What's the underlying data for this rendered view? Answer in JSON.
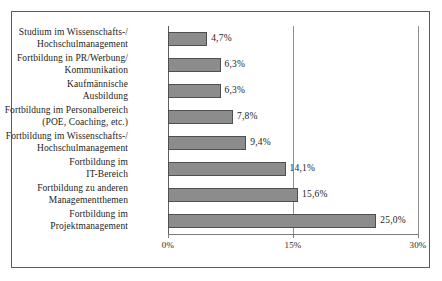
{
  "chart_data": {
    "type": "bar",
    "orientation": "horizontal",
    "title": "",
    "xlabel": "",
    "ylabel": "",
    "xlim": [
      0,
      30
    ],
    "grid": true,
    "legend": false,
    "xticks": [
      "0%",
      "15%",
      "30%"
    ],
    "xtick_values": [
      0,
      15,
      30
    ],
    "categories": [
      "Studium im Wissenschafts-/ Hochschulmanagement",
      "Fortbildung in PR/Werbung/ Kommunikation",
      "Kaufmännische Ausbildung",
      "Fortbildung im Personalbereich (POE, Coaching, etc.)",
      "Fortbildung im Wissenschafts-/ Hochschulmanagement",
      "Fortbildung im IT-Bereich",
      "Fortbildung zu anderen Managementthemen",
      "Fortbildung im Projektmanagement"
    ],
    "category_lines": [
      [
        "Studium im Wissenschafts-/",
        "Hochschulmanagement"
      ],
      [
        "Fortbildung in PR/Werbung/",
        "Kommunikation"
      ],
      [
        "Kaufmännische",
        "Ausbildung"
      ],
      [
        "Fortbildung im Personalbereich",
        "(POE, Coaching, etc.)"
      ],
      [
        "Fortbildung im Wissenschafts-/",
        "Hochschulmanagement"
      ],
      [
        "Fortbildung im",
        "IT-Bereich"
      ],
      [
        "Fortbildung zu anderen",
        "Managementthemen"
      ],
      [
        "Fortbildung im",
        "Projektmanagement"
      ]
    ],
    "values": [
      4.7,
      6.3,
      6.3,
      7.8,
      9.4,
      14.1,
      15.6,
      25.0
    ],
    "data_labels": [
      "4,7%",
      "6,3%",
      "6,3%",
      "7,8%",
      "9,4%",
      "14,1%",
      "15,6%",
      "25,0%"
    ],
    "colors": {
      "bar_fill": "#8c8c8c",
      "bar_border": "#4f4f4f",
      "gridline": "#8e8e8e",
      "axis": "#5e5e5e",
      "frame": "#5b5b5b",
      "text": "#1d1d1d",
      "background": "#ffffff"
    }
  }
}
